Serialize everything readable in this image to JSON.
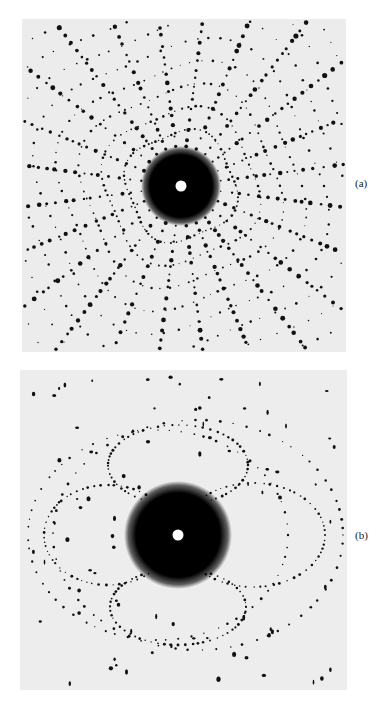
{
  "figure": {
    "panels": [
      {
        "id": "a",
        "label": "(a)",
        "description": "X-ray diffraction pattern with dense radial spot lattice and central beam stop"
      },
      {
        "id": "b",
        "label": "(b)",
        "description": "X-ray diffraction pattern with elliptical spot arcs and central beam stop"
      }
    ],
    "colors": {
      "background": "#ececec",
      "spot": "#111111",
      "center_hole": "#ffffff"
    }
  }
}
